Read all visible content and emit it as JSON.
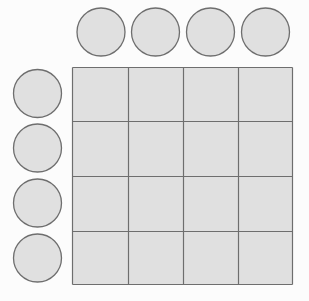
{
  "diagram": {
    "width": 309,
    "height": 301,
    "colors": {
      "background": "#fcfcfc",
      "fill": "#e0e0e0",
      "stroke": "#6e6e6e"
    },
    "grid": {
      "rows": 4,
      "cols": 4,
      "x": 72.5,
      "y": 67.5,
      "width": 220,
      "height": 217,
      "col_lines": [
        72.5,
        128.5,
        183.5,
        238.5,
        292.5
      ],
      "row_lines": [
        67.5,
        121.5,
        176.5,
        231.5,
        284.5
      ]
    },
    "top_circles": [
      {
        "cx": 101,
        "cy": 32,
        "r": 24
      },
      {
        "cx": 155.5,
        "cy": 32,
        "r": 24
      },
      {
        "cx": 210.5,
        "cy": 32,
        "r": 24
      },
      {
        "cx": 265.5,
        "cy": 32,
        "r": 24
      }
    ],
    "left_circles": [
      {
        "cx": 37.5,
        "cy": 93.5,
        "r": 24
      },
      {
        "cx": 37.5,
        "cy": 148,
        "r": 24
      },
      {
        "cx": 37.5,
        "cy": 203,
        "r": 24
      },
      {
        "cx": 37.5,
        "cy": 258,
        "r": 24
      }
    ]
  }
}
